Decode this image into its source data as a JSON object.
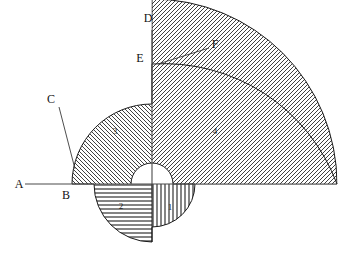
{
  "figure": {
    "canvas": {
      "width": 348,
      "height": 256
    },
    "center": {
      "x": 152,
      "y": 184
    },
    "background_color": "#ffffff",
    "outline_color": "#1a1a1a",
    "axis_color": "#4a4a4a"
  },
  "vertex_labels": [
    {
      "id": "A",
      "text": "A",
      "x": 19,
      "y": 188
    },
    {
      "id": "B",
      "text": "B",
      "x": 66,
      "y": 199
    },
    {
      "id": "C",
      "text": "C",
      "x": 51,
      "y": 103
    },
    {
      "id": "D",
      "text": "D",
      "x": 148,
      "y": 22
    },
    {
      "id": "E",
      "text": "E",
      "x": 140,
      "y": 62
    },
    {
      "id": "F",
      "text": "F",
      "x": 212,
      "y": 48
    }
  ],
  "regions": [
    {
      "id": "1",
      "label": "1",
      "label_x": 170,
      "label_y": 210,
      "hatch": "vertical",
      "radius": 43,
      "quadrant": "lower-right",
      "description": "Quarter disc with vertical line hatching"
    },
    {
      "id": "2",
      "label": "2",
      "label_x": 121,
      "label_y": 209,
      "hatch": "horizontal",
      "radius": 58,
      "quadrant": "lower-left",
      "description": "Quarter disc with horizontal line hatching"
    },
    {
      "id": "3",
      "label": "3",
      "label_x": 115,
      "label_y": 134,
      "hatch": "backslash",
      "radius": 80,
      "quadrant": "upper-left",
      "description": "Quarter disc with backslash diagonal hatching"
    },
    {
      "id": "4",
      "label": "4",
      "label_x": 215,
      "label_y": 134,
      "hatch": "forwardslash",
      "radius": 185,
      "quadrant": "upper-right",
      "description": "Quarter disc with forward slash diagonal hatching"
    }
  ],
  "inner_void": {
    "radius": 21,
    "description": "Unhatched white core semicircle above the horizontal axis"
  },
  "axes": [
    {
      "id": "horizontal-axis",
      "name": "axis-A",
      "x1": 25,
      "y1": 184,
      "x2": 337,
      "y2": 184
    },
    {
      "id": "vertical-axis",
      "name": "axis-D",
      "x1": 152,
      "y1": 30,
      "x2": 152,
      "y2": 196
    }
  ],
  "leaders": [
    {
      "id": "leader-C",
      "from_x": 59,
      "from_y": 107,
      "to_x": 75,
      "to_y": 169
    },
    {
      "id": "leader-F",
      "from_x": 209,
      "from_y": 48,
      "to_x": 158,
      "to_y": 64
    }
  ]
}
